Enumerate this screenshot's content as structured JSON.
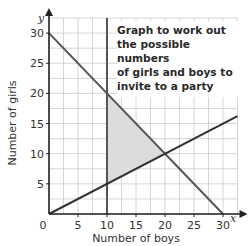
{
  "chart_data": {
    "type": "line",
    "title": "Graph to work out the possible numbers of girls and boys to invite to a party",
    "xlabel": "Number of boys",
    "ylabel": "Number of girls",
    "x_axis_var": "x",
    "y_axis_var": "y",
    "xlim": [
      0,
      32.5
    ],
    "ylim": [
      0,
      32.5
    ],
    "x_ticks": [
      0,
      5,
      10,
      15,
      20,
      25,
      30
    ],
    "y_ticks": [
      5,
      10,
      15,
      20,
      25,
      30
    ],
    "origin_label": "0",
    "grid": true,
    "grid_step": 2.5,
    "series": [
      {
        "name": "x + y = 30",
        "points": [
          [
            0,
            30
          ],
          [
            30,
            0
          ]
        ],
        "color": "#555555"
      },
      {
        "name": "x = 10",
        "points": [
          [
            10,
            0
          ],
          [
            10,
            32.5
          ]
        ],
        "color": "#555555"
      },
      {
        "name": "y = x/2",
        "points": [
          [
            0,
            0
          ],
          [
            32.5,
            16.25
          ]
        ],
        "color": "#333333"
      }
    ],
    "shaded_region": {
      "vertices": [
        [
          10,
          5
        ],
        [
          10,
          20
        ],
        [
          20,
          10
        ]
      ],
      "color": "#dcdcdc"
    },
    "intersections": [
      [
        10,
        20
      ],
      [
        10,
        5
      ],
      [
        20,
        10
      ]
    ]
  },
  "note": {
    "lines": [
      "Graph to work out",
      "the possible numbers",
      "of girls and boys to",
      "invite to a party"
    ]
  },
  "colors": {
    "grid": "#cccccc",
    "axis": "#222222",
    "line": "#555555",
    "shade": "#dcdcdc"
  }
}
